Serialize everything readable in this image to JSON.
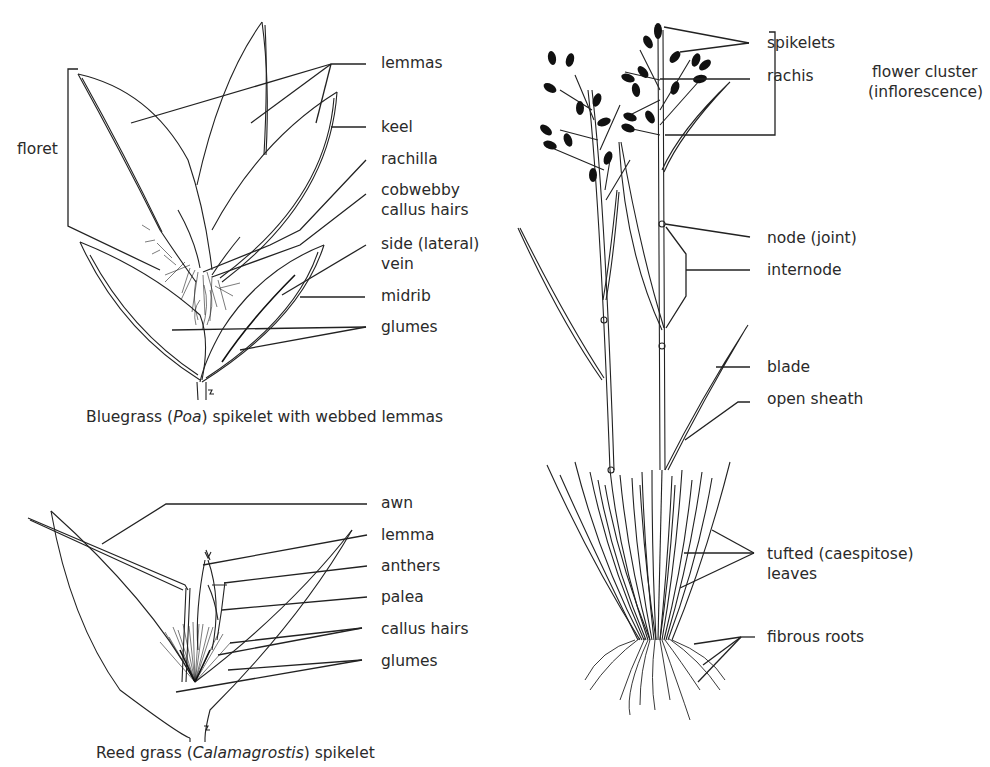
{
  "figures": {
    "bluegrass": {
      "caption_pre": "Bluegrass (",
      "caption_italic": "Poa",
      "caption_post": ") spikelet with webbed lemmas",
      "labels": {
        "floret": "floret",
        "lemmas": "lemmas",
        "keel": "keel",
        "rachilla": "rachilla",
        "cobwebby_1": "cobwebby",
        "cobwebby_2": "callus hairs",
        "side_vein_1": "side (lateral)",
        "side_vein_2": "vein",
        "midrib": "midrib",
        "glumes": "glumes"
      }
    },
    "reedgrass": {
      "caption_pre": "Reed grass (",
      "caption_italic": "Calamagrostis",
      "caption_post": ") spikelet",
      "labels": {
        "awn": "awn",
        "lemma": "lemma",
        "anthers": "anthers",
        "palea": "palea",
        "callus_hairs": "callus hairs",
        "glumes": "glumes"
      }
    },
    "plant": {
      "labels": {
        "spikelets": "spikelets",
        "rachis": "rachis",
        "flower_cluster_1": "flower cluster",
        "flower_cluster_2": "(inflorescence)",
        "node": "node (joint)",
        "internode": "internode",
        "blade": "blade",
        "open_sheath": "open sheath",
        "tufted_1": "tufted (caespitose)",
        "tufted_2": "leaves",
        "fibrous_roots": "fibrous roots"
      }
    }
  },
  "colors": {
    "ink": "#222222",
    "background": "#ffffff"
  }
}
